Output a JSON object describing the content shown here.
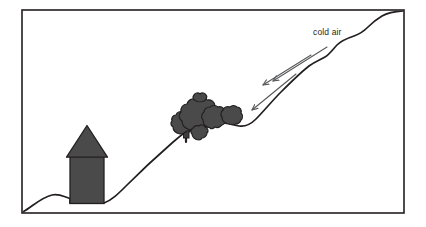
{
  "figure": {
    "title": "",
    "type": "schematic-diagram",
    "background_color": "#ffffff",
    "frame": {
      "name": "diagram-border",
      "stroke_color": "#231f20",
      "stroke_width": 1.6,
      "x": 22,
      "y": 10,
      "width": 382,
      "height": 203
    },
    "labels": [
      {
        "id": "cold-air",
        "text": "cold air",
        "x": 313,
        "y": 35,
        "font_size": 8.5,
        "color": "#231f20"
      }
    ],
    "arrows": {
      "name": "cold-air-flow-arrows",
      "count": 3,
      "color": "#58595b",
      "stroke_width": 1.1,
      "direction": "down-left",
      "items": [
        {
          "id": "arrow-upper",
          "x1": 326,
          "y1": 48,
          "x2": 272,
          "y2": 82
        },
        {
          "id": "arrow-middle",
          "x1": 310,
          "y1": 56,
          "x2": 262,
          "y2": 85
        },
        {
          "id": "arrow-lower",
          "x1": 295,
          "y1": 75,
          "x2": 251,
          "y2": 111
        }
      ]
    },
    "terrain": {
      "name": "hill-slope-ground-line",
      "stroke_color": "#231f20",
      "stroke_width": 1.7,
      "description": "undulating ground profile rising from bottom-left valley floor to top-right ridge"
    },
    "house": {
      "name": "house-shape",
      "fill_color": "#4a4a4a",
      "stroke_color": "#231f20",
      "body": {
        "x": 70,
        "y": 157,
        "width": 34,
        "height": 46
      },
      "roof": {
        "apex_x": 87,
        "apex_y": 126,
        "left_x": 67,
        "right_x": 107,
        "base_y": 157
      }
    },
    "trees": {
      "name": "tree-cluster",
      "fill_color": "#4a4a4a",
      "stroke_color": "#231f20",
      "count": 6,
      "description": "cluster of bushy tree crowns on the mid-slope with a small trunk"
    }
  }
}
